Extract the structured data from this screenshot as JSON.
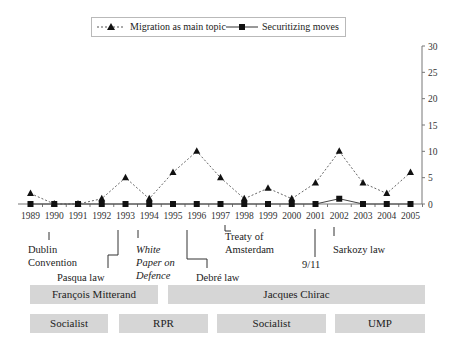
{
  "chart_data": {
    "type": "line",
    "title": "",
    "xlabel": "",
    "ylabel": "",
    "ylim": [
      0,
      30
    ],
    "yticks": [
      0,
      5,
      10,
      15,
      20,
      25,
      30
    ],
    "y_axis_position": "right",
    "grid": false,
    "legend_position": "top",
    "x": [
      "1989",
      "1990",
      "1991",
      "1992",
      "1993",
      "1994",
      "1995",
      "1996",
      "1997",
      "1998",
      "1999",
      "2000",
      "2001",
      "2002",
      "2003",
      "2004",
      "2005"
    ],
    "series": [
      {
        "name": "Migration as main topic",
        "style": "dashed",
        "marker": "triangle",
        "values": [
          2,
          0,
          0,
          1,
          5,
          1,
          6,
          10,
          5,
          1,
          3,
          1,
          4,
          10,
          4,
          2,
          6
        ]
      },
      {
        "name": "Securitizing moves",
        "style": "solid",
        "marker": "square",
        "values": [
          0,
          0,
          0,
          0,
          0,
          0,
          0,
          0,
          0,
          0,
          0,
          0,
          0,
          1,
          0,
          0,
          0
        ]
      }
    ],
    "annotations": [
      {
        "text": "Dublin Convention",
        "year": "1990",
        "italic": false
      },
      {
        "text": "Pasqua law",
        "year": "1993",
        "italic": false
      },
      {
        "text": "White Paper on Defence",
        "year": "1994",
        "italic": true
      },
      {
        "text": "Debré law",
        "year": "1996",
        "italic": false
      },
      {
        "text": "Treaty of Amsterdam",
        "year": "1997",
        "italic": false
      },
      {
        "text": "9/11",
        "year": "2001",
        "italic": false
      },
      {
        "text": "Sarkozy law",
        "year": "2002",
        "italic": false
      }
    ],
    "bands": {
      "presidents": [
        {
          "label": "François Mitterand",
          "from": "1989",
          "to": "1994"
        },
        {
          "label": "Jacques Chirac",
          "from": "1995",
          "to": "2005"
        }
      ],
      "governments": [
        {
          "label": "Socialist",
          "from": "1989",
          "to": "1992"
        },
        {
          "label": "RPR",
          "from": "1993",
          "to": "1996"
        },
        {
          "label": "Socialist",
          "from": "1997",
          "to": "2001"
        },
        {
          "label": "UMP",
          "from": "2002",
          "to": "2005"
        }
      ]
    }
  },
  "legend": {
    "series1": "Migration as main topic",
    "series2": "Securitizing moves"
  },
  "annotations": {
    "dublin1": "Dublin",
    "dublin2": "Convention",
    "pasqua": "Pasqua law",
    "white1": "White",
    "white2": "Paper on",
    "white3": "Defence",
    "debre": "Debré law",
    "treaty1": "Treaty of",
    "treaty2": "Amsterdam",
    "nineeleven": "9/11",
    "sarkozy": "Sarkozy law"
  },
  "bands": {
    "mitterand": "François Mitterand",
    "chirac": "Jacques Chirac",
    "socialist1": "Socialist",
    "rpr": "RPR",
    "socialist2": "Socialist",
    "ump": "UMP"
  }
}
